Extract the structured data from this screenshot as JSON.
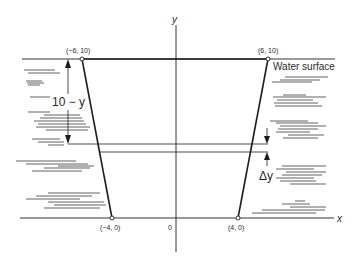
{
  "diagram": {
    "axes": {
      "x_label": "x",
      "y_label": "y",
      "origin_label": "0"
    },
    "vertices": {
      "top_left": "(−6, 10)",
      "top_right": "(6, 10)",
      "bottom_left": "(−4, 0)",
      "bottom_right": "(4, 0)"
    },
    "labels": {
      "water_surface": "Water surface",
      "depth": "10 − y",
      "strip_thickness": "Δy"
    },
    "colors": {
      "line": "#1e1e1e",
      "hatch": "#3a3a3a",
      "background": "#ffffff"
    }
  }
}
